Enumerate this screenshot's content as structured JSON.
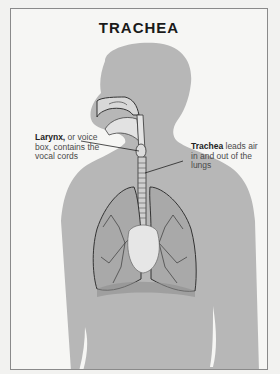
{
  "title": "TRACHEA",
  "labels": {
    "larynx": {
      "term": "Larynx,",
      "rest": " or voice box, contains the vocal cords"
    },
    "trachea": {
      "term": "Trachea",
      "rest": " leads air in and out of the lungs"
    }
  },
  "colors": {
    "silhouette": "#b5b5b5",
    "background": "#f6f6f4",
    "lung": "#9a9a9a",
    "line": "#222222"
  }
}
